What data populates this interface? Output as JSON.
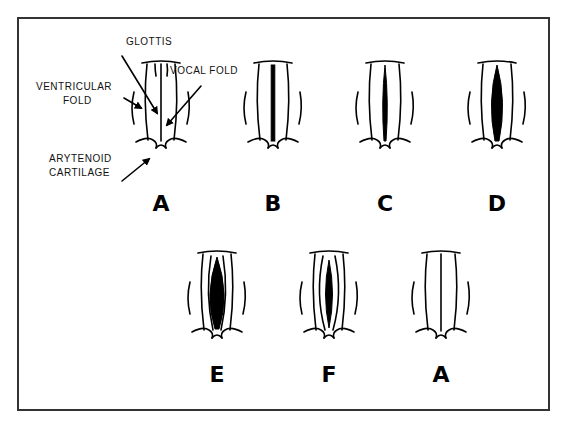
{
  "figure": {
    "annotations": {
      "glottis": "GLOTTIS",
      "vocal_fold": "VOCAL FOLD",
      "ventricular_fold_1": "VENTRICULAR",
      "ventricular_fold_2": "FOLD",
      "arytenoid_1": "ARYTENOID",
      "arytenoid_2": "CARTILAGE"
    },
    "panels": [
      {
        "id": "A1",
        "label": "A",
        "glottis_state": "closed"
      },
      {
        "id": "B",
        "label": "B",
        "glottis_state": "slightly open"
      },
      {
        "id": "C",
        "label": "C",
        "glottis_state": "opening"
      },
      {
        "id": "D",
        "label": "D",
        "glottis_state": "open"
      },
      {
        "id": "E",
        "label": "E",
        "glottis_state": "widest open"
      },
      {
        "id": "F",
        "label": "F",
        "glottis_state": "closing"
      },
      {
        "id": "A2",
        "label": "A",
        "glottis_state": "closed"
      }
    ],
    "colors": {
      "ink": "#000000",
      "frame": "#333333",
      "background": "#ffffff"
    }
  }
}
